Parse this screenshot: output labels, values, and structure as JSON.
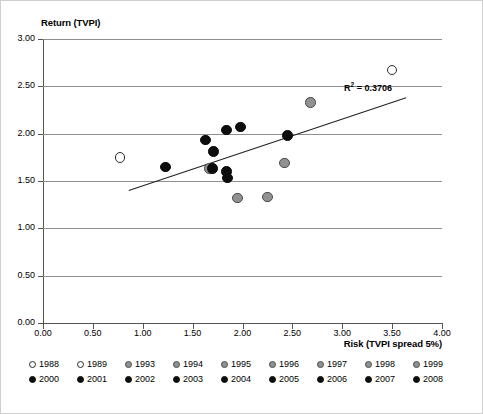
{
  "chart_data": {
    "type": "scatter",
    "title": "",
    "xlabel": "Risk (TVPI spread 5%)",
    "ylabel": "Return (TVPI)",
    "xlim": [
      0.0,
      4.0
    ],
    "ylim": [
      0.0,
      3.0
    ],
    "xticks": [
      "0.00",
      "0.50",
      "1.00",
      "1.50",
      "2.00",
      "2.50",
      "3.00",
      "3.50",
      "4.00"
    ],
    "yticks": [
      "0.00",
      "0.50",
      "1.00",
      "1.50",
      "2.00",
      "2.50",
      "3.00"
    ],
    "grid": true,
    "legend_position": "below-axes",
    "annotations": [
      {
        "text": "R² = 0.3706",
        "r_squared": 0.3706
      }
    ],
    "trendline": {
      "type": "linear",
      "x_start": 0.86,
      "y_start": 1.4,
      "x_end": 3.64,
      "y_end": 2.38,
      "r_squared": 0.3706
    },
    "series": [
      {
        "name": "1988",
        "marker": "open-circle",
        "color": "#ffffff",
        "points": []
      },
      {
        "name": "1989",
        "marker": "open-circle",
        "color": "#ffffff",
        "points": [
          {
            "x": 0.77,
            "y": 1.75
          }
        ]
      },
      {
        "name": "1993",
        "marker": "filled-circle",
        "color": "#919191",
        "points": [
          {
            "x": 3.5,
            "y": 2.67
          }
        ]
      },
      {
        "name": "1994",
        "marker": "filled-circle",
        "color": "#919191",
        "points": [
          {
            "x": 2.68,
            "y": 2.33
          }
        ]
      },
      {
        "name": "1995",
        "marker": "filled-circle",
        "color": "#919191",
        "points": [
          {
            "x": 2.42,
            "y": 1.69
          }
        ]
      },
      {
        "name": "1996",
        "marker": "filled-circle",
        "color": "#919191",
        "points": [
          {
            "x": 1.95,
            "y": 1.32
          }
        ]
      },
      {
        "name": "1997",
        "marker": "filled-circle",
        "color": "#919191",
        "points": [
          {
            "x": 2.25,
            "y": 1.33
          }
        ]
      },
      {
        "name": "1998",
        "marker": "filled-circle",
        "color": "#919191",
        "points": [
          {
            "x": 1.67,
            "y": 1.63
          }
        ]
      },
      {
        "name": "1999",
        "marker": "filled-circle",
        "color": "#919191",
        "points": []
      },
      {
        "name": "2000",
        "marker": "filled-circle",
        "color": "#0d0d0d",
        "points": [
          {
            "x": 1.23,
            "y": 1.65
          }
        ]
      },
      {
        "name": "2001",
        "marker": "filled-circle",
        "color": "#0d0d0d",
        "points": [
          {
            "x": 1.63,
            "y": 1.93
          }
        ]
      },
      {
        "name": "2002",
        "marker": "filled-circle",
        "color": "#0d0d0d",
        "points": [
          {
            "x": 1.71,
            "y": 1.81
          }
        ]
      },
      {
        "name": "2003",
        "marker": "filled-circle",
        "color": "#0d0d0d",
        "points": [
          {
            "x": 1.7,
            "y": 1.63
          }
        ]
      },
      {
        "name": "2004",
        "marker": "filled-circle",
        "color": "#0d0d0d",
        "points": [
          {
            "x": 1.84,
            "y": 2.04
          }
        ]
      },
      {
        "name": "2005",
        "marker": "filled-circle",
        "color": "#0d0d0d",
        "points": [
          {
            "x": 1.98,
            "y": 2.07
          }
        ]
      },
      {
        "name": "2006",
        "marker": "filled-circle",
        "color": "#0d0d0d",
        "points": [
          {
            "x": 1.84,
            "y": 1.6
          }
        ]
      },
      {
        "name": "2007",
        "marker": "filled-circle",
        "color": "#0d0d0d",
        "points": [
          {
            "x": 1.85,
            "y": 1.53
          }
        ]
      },
      {
        "name": "2008",
        "marker": "filled-circle",
        "color": "#0d0d0d",
        "points": [
          {
            "x": 2.45,
            "y": 1.98
          }
        ]
      }
    ],
    "all_points": [
      {
        "x": 0.77,
        "y": 1.75,
        "style": "white"
      },
      {
        "x": 1.23,
        "y": 1.65,
        "style": "black"
      },
      {
        "x": 1.63,
        "y": 1.93,
        "style": "black"
      },
      {
        "x": 1.71,
        "y": 1.81,
        "style": "black"
      },
      {
        "x": 1.67,
        "y": 1.63,
        "style": "gray"
      },
      {
        "x": 1.7,
        "y": 1.63,
        "style": "black"
      },
      {
        "x": 1.84,
        "y": 2.04,
        "style": "black"
      },
      {
        "x": 1.98,
        "y": 2.07,
        "style": "black"
      },
      {
        "x": 1.84,
        "y": 1.6,
        "style": "black"
      },
      {
        "x": 1.85,
        "y": 1.53,
        "style": "black"
      },
      {
        "x": 1.95,
        "y": 1.32,
        "style": "gray"
      },
      {
        "x": 2.25,
        "y": 1.33,
        "style": "gray"
      },
      {
        "x": 2.42,
        "y": 1.69,
        "style": "gray"
      },
      {
        "x": 2.45,
        "y": 1.98,
        "style": "black"
      },
      {
        "x": 2.68,
        "y": 2.33,
        "style": "gray"
      },
      {
        "x": 3.5,
        "y": 2.67,
        "style": "white"
      }
    ]
  },
  "legend": {
    "row1": [
      {
        "label": "1988",
        "style": "white"
      },
      {
        "label": "1989",
        "style": "white"
      },
      {
        "label": "1993",
        "style": "gray"
      },
      {
        "label": "1994",
        "style": "gray"
      },
      {
        "label": "1995",
        "style": "gray"
      },
      {
        "label": "1996",
        "style": "gray"
      },
      {
        "label": "1997",
        "style": "gray"
      },
      {
        "label": "1998",
        "style": "gray"
      },
      {
        "label": "1999",
        "style": "gray"
      }
    ],
    "row2": [
      {
        "label": "2000",
        "style": "black"
      },
      {
        "label": "2001",
        "style": "black"
      },
      {
        "label": "2002",
        "style": "black"
      },
      {
        "label": "2003",
        "style": "black"
      },
      {
        "label": "2004",
        "style": "black"
      },
      {
        "label": "2005",
        "style": "black"
      },
      {
        "label": "2006",
        "style": "black"
      },
      {
        "label": "2007",
        "style": "black"
      },
      {
        "label": "2008",
        "style": "black"
      }
    ]
  },
  "annotation": {
    "r_prefix": "R",
    "r_exp": "2",
    "r_value": " = 0.3706"
  },
  "colors": {
    "black_marker": "#0d0d0d",
    "gray_marker": "#919191",
    "white_marker": "#ffffff",
    "gridline": "#8e8e8e",
    "axis": "#555555",
    "trendline": "#222222"
  }
}
